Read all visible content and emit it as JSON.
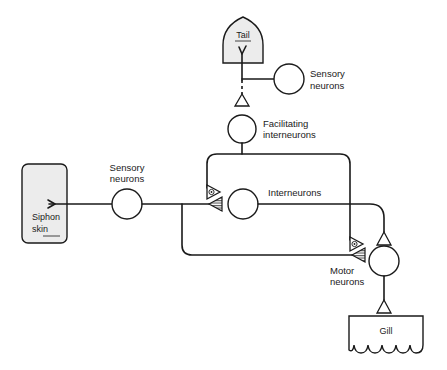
{
  "diagram": {
    "type": "neural-circuit",
    "colors": {
      "stroke": "#1a1a1a",
      "organ_fill": "#ececec",
      "background": "#ffffff"
    },
    "organs": {
      "tail": {
        "label": "Tail"
      },
      "siphon": {
        "label_line1": "Siphon",
        "label_line2": "skin"
      },
      "gill": {
        "label": "Gill"
      }
    },
    "neurons": {
      "tail_sensory": {
        "label_line1": "Sensory",
        "label_line2": "neurons"
      },
      "facilitating": {
        "label_line1": "Facilitating",
        "label_line2": "interneurons"
      },
      "siphon_sensory": {
        "label_line1": "Sensory",
        "label_line2": "neurons"
      },
      "interneurons": {
        "label": "Interneurons"
      },
      "motor": {
        "label_line1": "Motor",
        "label_line2": "neurons"
      }
    },
    "synapses": [
      {
        "name": "facilitating-to-sensory-terminal-on-interneuron",
        "style": "open-with-dot"
      },
      {
        "name": "sensory-to-interneuron",
        "style": "hatched"
      },
      {
        "name": "facilitating-to-sensory-terminal-on-motor",
        "style": "open-with-dot"
      },
      {
        "name": "sensory-to-motor",
        "style": "hatched"
      },
      {
        "name": "interneuron-to-motor",
        "style": "open"
      },
      {
        "name": "motor-to-gill",
        "style": "open"
      },
      {
        "name": "tail-sensory-to-facilitating",
        "style": "open"
      }
    ]
  }
}
